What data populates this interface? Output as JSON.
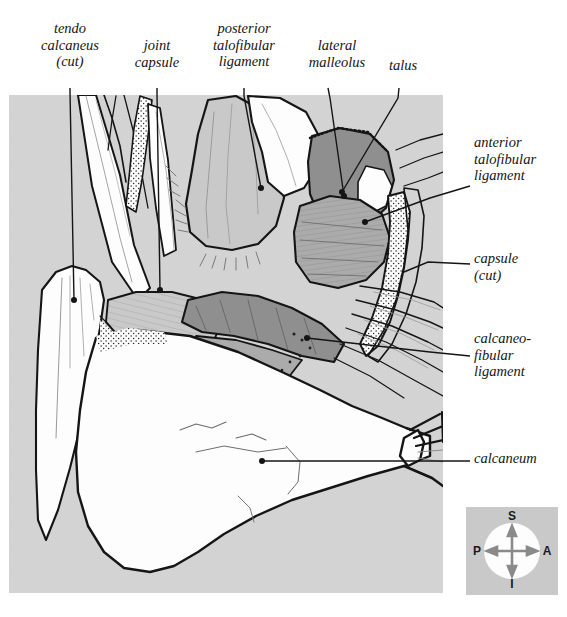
{
  "figure": {
    "kind": "anatomical-line-illustration",
    "panel": {
      "background_color": "#d5d5d5",
      "x": 9,
      "y": 95,
      "width": 434,
      "height": 498
    },
    "palette": {
      "ink": "#151515",
      "bone_white": "#fdfdfd",
      "light_grey": "#c9c9c9",
      "mid_grey": "#ababab",
      "dark_grey": "#8f8f8f",
      "panel_grey": "#d5d5d5"
    }
  },
  "labels": [
    {
      "id": "tendo-calcaneus",
      "text": "tendo\ncalcaneus\n(cut)",
      "align": "center",
      "x": 24,
      "y": 20,
      "width": 92,
      "leader": [
        [
          70,
          88
        ],
        [
          70,
          90
        ],
        [
          74,
          300
        ]
      ],
      "dot": [
        74,
        300
      ]
    },
    {
      "id": "joint-capsule",
      "text": "joint\ncapsule",
      "align": "center",
      "x": 122,
      "y": 37,
      "width": 70,
      "leader": [
        [
          157,
          88
        ],
        [
          157,
          94
        ],
        [
          160,
          290
        ]
      ],
      "dot": [
        160,
        290
      ]
    },
    {
      "id": "posterior-talofibular",
      "text": "posterior\ntalofibular\nligament",
      "align": "center",
      "x": 196,
      "y": 20,
      "width": 96,
      "leader": [
        [
          244,
          88
        ],
        [
          244,
          94
        ],
        [
          261,
          188
        ]
      ],
      "dot": [
        261,
        188
      ]
    },
    {
      "id": "lateral-malleolus",
      "text": "lateral\nmalleolus",
      "align": "center",
      "x": 296,
      "y": 37,
      "width": 82,
      "leader": [
        [
          328,
          88
        ],
        [
          330,
          96
        ],
        [
          344,
          196
        ]
      ],
      "dot": [
        344,
        196
      ]
    },
    {
      "id": "talus",
      "text": "talus",
      "align": "center",
      "x": 376,
      "y": 57,
      "width": 54,
      "leader": [
        [
          399,
          88
        ],
        [
          398,
          96
        ],
        [
          342,
          192
        ]
      ],
      "dot": [
        342,
        192
      ]
    },
    {
      "id": "anterior-talofibular",
      "text": "anterior\ntalofibular\nligament",
      "align": "left",
      "x": 474,
      "y": 134,
      "width": 92,
      "leader": [
        [
          470,
          186
        ],
        [
          430,
          198
        ],
        [
          365,
          222
        ]
      ],
      "dot": [
        365,
        222
      ]
    },
    {
      "id": "capsule-cut",
      "text": "capsule\n(cut)",
      "align": "left",
      "x": 474,
      "y": 250,
      "width": 92,
      "leader": [
        [
          470,
          264
        ],
        [
          430,
          262
        ],
        [
          404,
          272
        ]
      ],
      "dot": [
        404,
        272
      ]
    },
    {
      "id": "calcaneo-fibular",
      "text": "calcaneo-\nfibular\nligament",
      "align": "left",
      "x": 474,
      "y": 330,
      "width": 96,
      "leader": [
        [
          470,
          356
        ],
        [
          432,
          352
        ],
        [
          307,
          338
        ]
      ],
      "dot": [
        307,
        338
      ]
    },
    {
      "id": "calcaneum",
      "text": "calcaneum",
      "align": "left",
      "x": 474,
      "y": 450,
      "width": 96,
      "leader": [
        [
          470,
          461
        ],
        [
          430,
          461
        ],
        [
          262,
          461
        ]
      ],
      "dot": [
        262,
        461
      ]
    }
  ],
  "compass": {
    "id": "orientation-compass",
    "background_color": "#c9c9c9",
    "disc_color": "#fdfdfd",
    "arrow_color": "#8a8a8a",
    "directions": {
      "superior": "S",
      "inferior": "I",
      "posterior": "P",
      "anterior": "A"
    }
  }
}
